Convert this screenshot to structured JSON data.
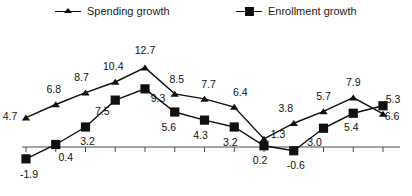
{
  "legend": {
    "position": "top",
    "entries": [
      {
        "label": "Spending growth",
        "marker": "triangle-marker-icon",
        "color": "#101010"
      },
      {
        "label": "Enrollment growth",
        "marker": "square-marker-icon",
        "color": "#101010"
      }
    ]
  },
  "chart_data": {
    "type": "line",
    "title": "",
    "xlabel": "",
    "ylabel": "",
    "grid": false,
    "legend_position": "top",
    "zero_line": true,
    "ylim": [
      -3.2,
      14.2
    ],
    "categories": [
      "",
      "",
      "",
      "",
      "",
      "",
      "",
      "",
      "",
      "",
      "",
      "",
      ""
    ],
    "series": [
      {
        "name": "Spending growth",
        "marker": "triangle",
        "color": "#101010",
        "values": [
          4.7,
          6.8,
          8.7,
          10.4,
          12.7,
          8.5,
          7.7,
          6.4,
          1.3,
          3.8,
          5.7,
          7.9,
          5.3
        ]
      },
      {
        "name": "Enrollment growth",
        "marker": "square",
        "color": "#101010",
        "values": [
          -1.9,
          0.4,
          3.2,
          7.5,
          9.3,
          5.6,
          4.3,
          3.2,
          0.2,
          -0.6,
          3.0,
          5.4,
          6.6
        ]
      }
    ]
  },
  "data_labels": {
    "spending": [
      "4.7",
      "6.8",
      "8.7",
      "10.4",
      "12.7",
      "8.5",
      "7.7",
      "6.4",
      "1.3",
      "3.8",
      "5.7",
      "7.9",
      "5.3"
    ],
    "enrollment": [
      "-1.9",
      "0.4",
      "3.2",
      "7.5",
      "9.3",
      "5.6",
      "4.3",
      "3.2",
      "0.2",
      "-0.6",
      "3.0",
      "5.4",
      "6.6"
    ]
  },
  "axis": {
    "tick_count": 13,
    "labels_visible": false
  }
}
